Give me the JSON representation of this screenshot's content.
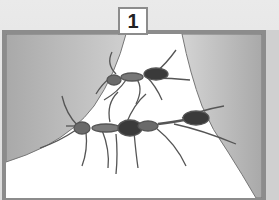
{
  "panel": {
    "number": "1",
    "subject": "ants forming a bridge between two leaves",
    "colors": {
      "frame": "#8c8c8c",
      "leaf": "#b8b8b8",
      "background": "#ffffff",
      "ant_body": "#3a3a3a"
    }
  }
}
